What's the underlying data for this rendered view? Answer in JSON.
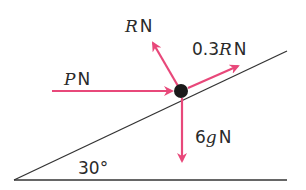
{
  "diagram": {
    "type": "free-body-diagram",
    "colors": {
      "force_arrow": "#e8487a",
      "line": "#333333",
      "particle": "#1a1a1a",
      "text": "#2a2a2a"
    },
    "incline": {
      "angle_label": "30°"
    },
    "forces": [
      {
        "id": "applied",
        "var": "P",
        "unit": "N",
        "direction": "horizontal, toward particle"
      },
      {
        "id": "normal",
        "var": "R",
        "unit": "N",
        "direction": "perpendicular to plane, away"
      },
      {
        "id": "friction",
        "coef": "0.3",
        "var": "R",
        "unit": "N",
        "direction": "up the slope"
      },
      {
        "id": "weight",
        "coef": "6",
        "var": "g",
        "unit": "N",
        "direction": "vertically down"
      }
    ],
    "labels": {
      "P_var": "P",
      "P_unit": "N",
      "R_var": "R",
      "R_unit": "N",
      "F_coef": "0.3",
      "F_var": "R",
      "F_unit": "N",
      "W_coef": "6",
      "W_var": "g",
      "W_unit": "N",
      "angle": "30°"
    }
  }
}
